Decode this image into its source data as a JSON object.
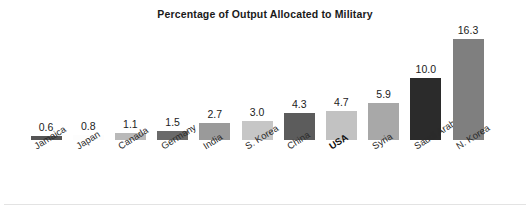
{
  "chart_data": {
    "type": "bar",
    "title": "Percentage of Output Allocated to Military",
    "xlabel": "",
    "ylabel": "",
    "ylim": [
      0,
      16.3
    ],
    "grid": false,
    "legend": "none",
    "value_labels_shown": true,
    "categories": [
      "Jamaica",
      "Japan",
      "Canada",
      "Germany",
      "India",
      "S. Korea",
      "China",
      "USA",
      "Syria",
      "Saudi Arabia",
      "N. Korea"
    ],
    "values": [
      0.6,
      0.8,
      1.1,
      1.5,
      2.7,
      3.0,
      4.3,
      4.7,
      5.9,
      10.0,
      16.3
    ],
    "value_text": [
      "0.6",
      "0.8",
      "1.1",
      "1.5",
      "2.7",
      "3.0",
      "4.3",
      "4.7",
      "5.9",
      "10.0",
      "16.3"
    ],
    "bar_colors": [
      "#555555",
      "#fdfdfd",
      "#b9b9b9",
      "#6a6a6a",
      "#9a9a9a",
      "#c6c6c6",
      "#5c5c5c",
      "#c2c2c2",
      "#a8a8a8",
      "#2b2b2b",
      "#7f7f7f"
    ],
    "highlighted_category": "USA",
    "axis_labels_rotated": true
  },
  "figure": {
    "background_color": "#ffffff",
    "title_color": "#1a1a1a"
  }
}
